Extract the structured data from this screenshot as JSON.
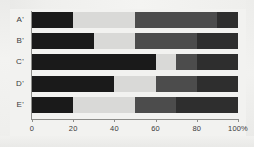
{
  "chart_data": {
    "type": "bar",
    "orientation": "horizontal",
    "stacked": true,
    "title": "",
    "subtitle": "",
    "xlabel": "",
    "ylabel": "",
    "xlim": [
      0,
      100
    ],
    "grid": false,
    "legend": "none",
    "categories": [
      "A'",
      "B'",
      "C'",
      "D'",
      "E'"
    ],
    "xticks": [
      0,
      20,
      40,
      60,
      80,
      100
    ],
    "xticklabels": [
      "0",
      "20",
      "40",
      "60",
      "80",
      "100%"
    ],
    "series": [
      {
        "name": "Segment 1",
        "color": "#1a1a1a",
        "values": [
          20,
          30,
          60,
          40,
          20
        ]
      },
      {
        "name": "Segment 2",
        "color": "#d9d9d7",
        "values": [
          30,
          20,
          10,
          20,
          30
        ]
      },
      {
        "name": "Segment 3",
        "color": "#4c4c4c",
        "values": [
          40,
          30,
          10,
          20,
          20
        ]
      },
      {
        "name": "Segment 4",
        "color": "#2e2e2e",
        "values": [
          10,
          20,
          20,
          20,
          30
        ]
      }
    ]
  },
  "colors": {
    "background": "#f2f2f0",
    "axis": "#8d8d8a",
    "tick_text": "#3b3b3b"
  }
}
